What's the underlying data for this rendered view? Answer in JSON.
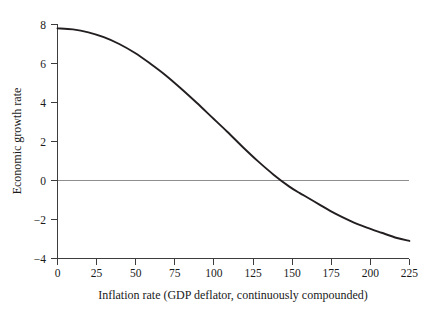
{
  "chart_data": {
    "type": "line",
    "title": "",
    "subtitle": "",
    "xlabel": "Inflation rate (GDP deflator, continuously compounded)",
    "ylabel": "Economic growth rate",
    "xlim": [
      0,
      228
    ],
    "ylim": [
      -4,
      8
    ],
    "xticks": [
      0,
      25,
      50,
      75,
      100,
      125,
      150,
      175,
      200,
      225
    ],
    "xtick_labels": [
      "0",
      "25",
      "50",
      "75",
      "100",
      "125",
      "150",
      "175",
      "200",
      "225"
    ],
    "yticks": [
      -4,
      -2,
      0,
      2,
      4,
      6,
      8
    ],
    "ytick_labels": [
      "−4",
      "−2",
      "0",
      "2",
      "4",
      "6",
      "8"
    ],
    "grid": false,
    "legend": null,
    "legend_position": "none",
    "annotations": [],
    "reference_lines": [
      {
        "name": "zero-growth-line",
        "orientation": "horizontal",
        "value": 0,
        "color": "#8e8e8e"
      }
    ],
    "series": [
      {
        "name": "Growth vs inflation",
        "color": "#231f20",
        "x": [
          0,
          10,
          20,
          30,
          40,
          50,
          60,
          70,
          80,
          90,
          100,
          110,
          120,
          130,
          140,
          150,
          157,
          160,
          170,
          180,
          190,
          200,
          210,
          220,
          228
        ],
        "y": [
          7.8,
          7.75,
          7.6,
          7.35,
          7.0,
          6.55,
          6.0,
          5.4,
          4.72,
          4.0,
          3.25,
          2.5,
          1.72,
          0.98,
          0.3,
          -0.3,
          -0.65,
          -0.78,
          -1.25,
          -1.7,
          -2.08,
          -2.4,
          -2.68,
          -2.95,
          -3.1
        ]
      }
    ],
    "zero_crossing": 157,
    "max_value": 7.8,
    "min_value": -3.1
  }
}
